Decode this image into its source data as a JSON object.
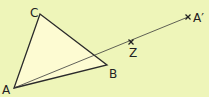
{
  "diagram": {
    "type": "geometry-enlargement",
    "colors": {
      "background": "#eef5b9",
      "triangle_fill": "#fdfbd2",
      "stroke": "#2a2a2a"
    },
    "points": {
      "A": {
        "label": "A",
        "x": 14,
        "y": 88
      },
      "B": {
        "label": "B",
        "x": 107,
        "y": 65
      },
      "C": {
        "label": "C",
        "x": 40,
        "y": 14
      },
      "Z": {
        "label": "Z",
        "x": 131,
        "y": 42
      },
      "A_prime": {
        "label": "A′",
        "x": 188,
        "y": 17
      }
    },
    "shapes": [
      {
        "kind": "triangle",
        "vertices": [
          "A",
          "B",
          "C"
        ]
      },
      {
        "kind": "line",
        "from": "A",
        "to": "A_prime",
        "through": "Z"
      }
    ],
    "marks": [
      {
        "point": "Z",
        "style": "cross"
      },
      {
        "point": "A_prime",
        "style": "cross"
      }
    ]
  }
}
